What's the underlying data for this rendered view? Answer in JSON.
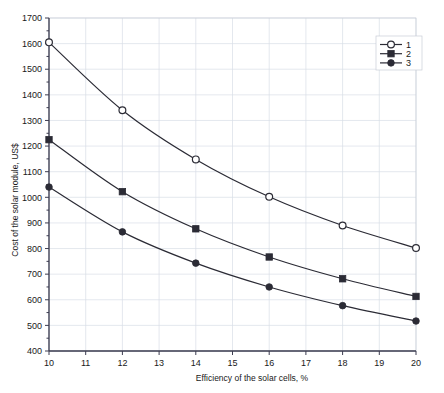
{
  "chart_data": {
    "type": "line",
    "title": "",
    "xlabel": "Efficiency of the solar cells, %",
    "ylabel": "Cost of the solar module, US$",
    "x": [
      10,
      12,
      14,
      16,
      18,
      20
    ],
    "xlim": [
      10,
      20
    ],
    "ylim": [
      400,
      1700
    ],
    "xticks": [
      10,
      11,
      12,
      13,
      14,
      15,
      16,
      17,
      18,
      19,
      20
    ],
    "yticks": [
      400,
      500,
      600,
      700,
      800,
      900,
      1000,
      1100,
      1200,
      1300,
      1400,
      1500,
      1600,
      1700
    ],
    "grid": true,
    "legend_position": "top-right",
    "series": [
      {
        "name": "1",
        "marker": "open-circle",
        "color": "#2b2b35",
        "values": [
          1605,
          1340,
          1148,
          1002,
          890,
          802
        ]
      },
      {
        "name": "2",
        "marker": "filled-square",
        "color": "#2b2b35",
        "values": [
          1225,
          1022,
          877,
          767,
          682,
          613
        ]
      },
      {
        "name": "3",
        "marker": "filled-circle",
        "color": "#2b2b35",
        "values": [
          1040,
          865,
          743,
          650,
          577,
          517
        ]
      }
    ]
  },
  "axes": {
    "x_title": "Efficiency of the solar cells, %",
    "y_title": "Cost of the solar module, US$",
    "x_tick_labels": [
      "10",
      "11",
      "12",
      "13",
      "14",
      "15",
      "16",
      "17",
      "18",
      "19",
      "20"
    ],
    "y_tick_labels": [
      "400",
      "500",
      "600",
      "700",
      "800",
      "900",
      "1000",
      "1100",
      "1200",
      "1300",
      "1400",
      "1500",
      "1600",
      "1700"
    ]
  },
  "legend": {
    "entries": [
      {
        "label": "1"
      },
      {
        "label": "2"
      },
      {
        "label": "3"
      }
    ]
  },
  "colors": {
    "line": "#2b2b35",
    "grid": "#d9dee6",
    "axis": "#3c3c50",
    "text": "#1a1a1a",
    "background": "#ffffff"
  }
}
